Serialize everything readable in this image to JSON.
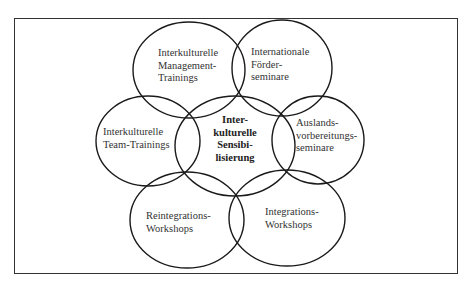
{
  "diagram": {
    "type": "overlapping-circles",
    "center": {
      "lines": [
        "Inter-",
        "kulturelle",
        "Sensibi-",
        "lisierung"
      ],
      "text": "Interkulturelle Sensibilisierung"
    },
    "nodes": [
      {
        "id": "top-left",
        "lines": [
          "Interkulturelle",
          "Management-",
          "Trainings"
        ],
        "text": "Interkulturelle Management-Trainings"
      },
      {
        "id": "top-right",
        "lines": [
          "Internationale",
          "Förder-",
          "seminare"
        ],
        "text": "Internationale Förderseminare"
      },
      {
        "id": "middle-left",
        "lines": [
          "Interkulturelle",
          "Team-Trainings"
        ],
        "text": "Interkulturelle Team-Trainings"
      },
      {
        "id": "middle-right",
        "lines": [
          "Auslands-",
          "vorbereitungs-",
          "seminare"
        ],
        "text": "Auslandsvorbereitungsseminare"
      },
      {
        "id": "bottom-left",
        "lines": [
          "Reintegrations-",
          "Workshops"
        ],
        "text": "Reintegrations-Workshops"
      },
      {
        "id": "bottom-right",
        "lines": [
          "Integrations-",
          "Workshops"
        ],
        "text": "Integrations-Workshops"
      }
    ],
    "stroke_color": "#1a1a1a",
    "frame_color": "#333333"
  }
}
